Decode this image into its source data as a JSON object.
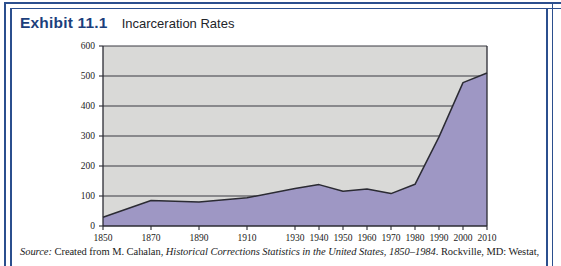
{
  "figure": {
    "exhibit_number": "Exhibit 11.1",
    "exhibit_title": "Incarceration Rates",
    "frame_color": "#2b4f8e",
    "number_color": "#1c3f7c"
  },
  "source": {
    "label": "Source:",
    "text_before": " Created from M. Cahalan, ",
    "work_title": "Historical Corrections Statistics in the United States, 1850–1984",
    "text_after": ". Rockville, MD: Westat,"
  },
  "chart_data": {
    "type": "area",
    "title": "Incarceration Rates",
    "xlabel": "",
    "ylabel": "",
    "ylim": [
      0,
      600
    ],
    "yticks": [
      0,
      100,
      200,
      300,
      400,
      500,
      600
    ],
    "grid": true,
    "legend": "none",
    "plot_background": "#d9d9d7",
    "area_fill": "#9e97c4",
    "line_color": "#2b2b33",
    "categories": [
      "1850",
      "1870",
      "1890",
      "1910",
      "1930",
      "1940",
      "1950",
      "1960",
      "1970",
      "1980",
      "1990",
      "2000",
      "2010"
    ],
    "values": [
      29,
      85,
      80,
      94,
      125,
      138,
      116,
      123,
      108,
      139,
      297,
      478,
      510
    ],
    "series": [
      {
        "name": "Incarceration rate per 100,000",
        "values": [
          29,
          85,
          80,
          94,
          125,
          138,
          116,
          123,
          108,
          139,
          297,
          478,
          510
        ]
      }
    ]
  }
}
